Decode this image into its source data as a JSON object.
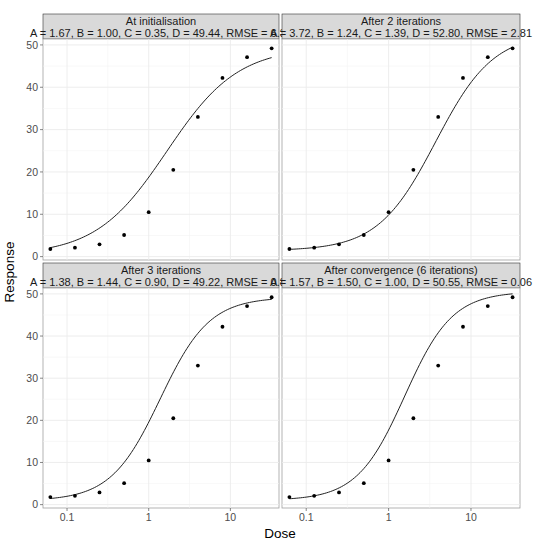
{
  "chart_data": {
    "type": "scatter",
    "layout": "2x2 facet grid",
    "xlabel": "Dose",
    "ylabel": "Response",
    "x_scale": "log10",
    "x_ticks": [
      0.1,
      1,
      10
    ],
    "x_tick_labels": [
      "0.1",
      "1",
      "10"
    ],
    "y_ticks": [
      0,
      10,
      20,
      30,
      40,
      50
    ],
    "y_tick_labels": [
      "0",
      "10",
      "20",
      "30",
      "40",
      "50"
    ],
    "ylim": [
      0,
      50
    ],
    "grid": true,
    "observed": {
      "dose": [
        0.0625,
        0.125,
        0.25,
        0.5,
        1,
        2,
        4,
        8,
        16,
        32
      ],
      "response": [
        1.8,
        2.1,
        2.9,
        5.1,
        10.5,
        20.5,
        33.0,
        42.2,
        47.1,
        49.2
      ]
    },
    "panels": [
      {
        "title": "At initialisation",
        "subtitle": "A = 1.67, B = 1.00, C = 0.35, D = 49.44, RMSE = 6.32",
        "params": {
          "A": 1.67,
          "B": 1.0,
          "C": 0.35,
          "D": 49.44,
          "RMSE": 6.32
        }
      },
      {
        "title": "After 2 iterations",
        "subtitle": "A = 3.72, B = 1.24, C = 1.39, D = 52.80, RMSE = 2.81",
        "params": {
          "A": 3.72,
          "B": 1.24,
          "C": 1.39,
          "D": 52.8,
          "RMSE": 2.81
        }
      },
      {
        "title": "After 3 iterations",
        "subtitle": "A = 1.38, B = 1.44, C = 0.90, D = 49.22, RMSE = 0.89",
        "params": {
          "A": 1.38,
          "B": 1.44,
          "C": 0.9,
          "D": 49.22,
          "RMSE": 0.89
        }
      },
      {
        "title": "After convergence (6 iterations)",
        "subtitle": "A = 1.57, B = 1.50, C = 1.00, D = 50.55, RMSE = 0.06",
        "params": {
          "A": 1.57,
          "B": 1.5,
          "C": 1.0,
          "D": 50.55,
          "RMSE": 0.06
        }
      }
    ]
  },
  "labels": {
    "x_axis_title": "Dose",
    "y_axis_title": "Response"
  }
}
